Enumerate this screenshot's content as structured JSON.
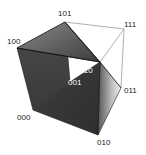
{
  "diagram": {
    "type": "3d-cube-simplex",
    "vertices": [
      {
        "id": "101",
        "label": "101",
        "x": 65,
        "y": 22,
        "lx": 58,
        "ly": 10,
        "color": "#222222"
      },
      {
        "id": "100",
        "label": "100",
        "x": 17,
        "y": 48,
        "lx": 7,
        "ly": 38,
        "color": "#222222"
      },
      {
        "id": "111",
        "label": "111",
        "x": 124,
        "y": 29,
        "lx": 124,
        "ly": 21,
        "color": "#222222"
      },
      {
        "id": "110",
        "label": "110",
        "x": 100,
        "y": 62,
        "lx": 80,
        "ly": 67,
        "color": "#ffffff"
      },
      {
        "id": "001",
        "label": "001",
        "x": 70,
        "y": 82,
        "lx": 68,
        "ly": 79,
        "color": "#ffffff"
      },
      {
        "id": "011",
        "label": "011",
        "x": 121,
        "y": 88,
        "lx": 124,
        "ly": 87,
        "color": "#222222"
      },
      {
        "id": "000",
        "label": "000",
        "x": 33,
        "y": 110,
        "lx": 17,
        "ly": 114,
        "color": "#222222"
      },
      {
        "id": "010",
        "label": "010",
        "x": 98,
        "y": 135,
        "lx": 97,
        "ly": 139,
        "color": "#222222"
      }
    ],
    "wireframe_edges": [
      [
        "101",
        "111"
      ],
      [
        "111",
        "011"
      ],
      [
        "111",
        "110"
      ]
    ],
    "colors": {
      "face_dark": "#3a3a3a",
      "face_mid": "#5a5a5a",
      "face_light": "#d8d8d8",
      "edge": "#1a1a1a",
      "wire": "#9a9a9a"
    }
  }
}
